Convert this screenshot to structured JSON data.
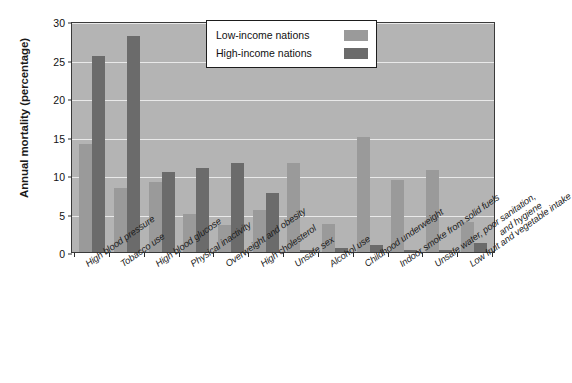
{
  "chart_data": {
    "type": "bar",
    "title": "",
    "xlabel": "",
    "ylabel": "Annual mortality (percentage)",
    "ylim": [
      0,
      30
    ],
    "yticks": [
      0,
      5,
      10,
      15,
      20,
      25,
      30
    ],
    "grid": true,
    "legend_position": "top-right",
    "categories": [
      "High blood pressure",
      "Tobacco use",
      "High blood glucose",
      "Physical inactivity",
      "Overweight and obesity",
      "High cholesterol",
      "Unsafe sex",
      "Alcohol use",
      "Childhood underweight",
      "Indoor smoke from solid fuels",
      "Unsafe water, poor sanitation, and hygiene",
      "Low fruit and vegetable intake"
    ],
    "categories_display": [
      [
        "High blood pressure"
      ],
      [
        "Tobacco use"
      ],
      [
        "High blood glucose"
      ],
      [
        "Physical inactivity"
      ],
      [
        "Overweight and obesity"
      ],
      [
        "High cholesterol"
      ],
      [
        "Unsafe sex"
      ],
      [
        "Alcohol use"
      ],
      [
        "Childhood underweight"
      ],
      [
        "Indoor smoke from solid fuels"
      ],
      [
        "Unsafe water, poor sanitation,",
        "and hygiene"
      ],
      [
        "Low fruit and vegetable intake"
      ]
    ],
    "series": [
      {
        "name": "Low-income nations",
        "color": "#9a9a9a",
        "values": [
          14.0,
          8.3,
          9.1,
          4.9,
          3.5,
          5.4,
          11.5,
          3.6,
          14.9,
          9.4,
          10.6,
          3.9
        ]
      },
      {
        "name": "High-income nations",
        "color": "#6b6b6b",
        "values": [
          25.5,
          28.0,
          10.4,
          10.9,
          11.5,
          7.6,
          0.3,
          0.5,
          0.9,
          0.3,
          0.2,
          1.2
        ]
      }
    ]
  },
  "legend": {
    "entries": [
      {
        "label": "Low-income nations"
      },
      {
        "label": "High-income nations"
      }
    ]
  },
  "colors": {
    "plot_background": "#b4b4b4",
    "gridline": "#e9e9e9",
    "axis": "#2e2e2e",
    "page_background": "#ffffff"
  }
}
